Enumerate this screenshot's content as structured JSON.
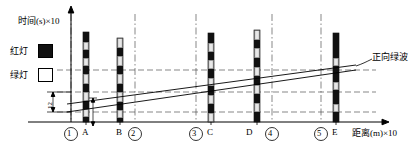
{
  "figure": {
    "type": "time-space-diagram",
    "y_axis_label": "时间(s)×10",
    "x_axis_label": "距离(m)×10",
    "band_label": "正向绿波",
    "offset_label": "12",
    "legend": [
      {
        "label": "红灯",
        "swatch": "filled-black-square",
        "meaning": "red-light"
      },
      {
        "label": "绿灯",
        "swatch": "empty-white-square",
        "meaning": "green-light"
      }
    ],
    "x_ticks": [
      {
        "id": "1",
        "label": "①",
        "circled": true,
        "x": 71
      },
      {
        "id": "A",
        "label": "A",
        "circled": false,
        "x": 86
      },
      {
        "id": "B",
        "label": "B",
        "circled": false,
        "x": 120
      },
      {
        "id": "2",
        "label": "②",
        "circled": true,
        "x": 135
      },
      {
        "id": "3",
        "label": "③",
        "circled": true,
        "x": 196
      },
      {
        "id": "C",
        "label": "C",
        "circled": false,
        "x": 211
      },
      {
        "id": "D",
        "label": "D",
        "circled": false,
        "x": 257
      },
      {
        "id": "4",
        "label": "④",
        "circled": true,
        "x": 272
      },
      {
        "id": "5",
        "label": "⑤",
        "circled": true,
        "x": 321
      },
      {
        "id": "E",
        "label": "E",
        "circled": false,
        "x": 336
      }
    ],
    "gridlines_vertical_x": [
      71,
      135,
      196,
      272,
      321
    ],
    "gridlines_horizontal_y": [
      70,
      92,
      112
    ],
    "axes": {
      "origin_x": 57,
      "origin_y": 122,
      "top_y": 8,
      "right_x": 388
    },
    "signal_bars": [
      {
        "at": "A",
        "x": 86,
        "top": 32,
        "bottom": 122,
        "segments": [
          {
            "state": "red",
            "y0": 32,
            "y1": 42
          },
          {
            "state": "green",
            "y0": 42,
            "y1": 50
          },
          {
            "state": "red",
            "y0": 50,
            "y1": 58
          },
          {
            "state": "green",
            "y0": 58,
            "y1": 66
          },
          {
            "state": "red",
            "y0": 66,
            "y1": 74
          },
          {
            "state": "green",
            "y0": 74,
            "y1": 84
          },
          {
            "state": "red",
            "y0": 84,
            "y1": 92
          },
          {
            "state": "green",
            "y0": 92,
            "y1": 101
          },
          {
            "state": "red",
            "y0": 101,
            "y1": 109
          },
          {
            "state": "green",
            "y0": 109,
            "y1": 117
          },
          {
            "state": "red",
            "y0": 117,
            "y1": 122
          }
        ]
      },
      {
        "at": "B",
        "x": 120,
        "top": 38,
        "bottom": 122,
        "segments": [
          {
            "state": "green",
            "y0": 38,
            "y1": 48
          },
          {
            "state": "red",
            "y0": 48,
            "y1": 56
          },
          {
            "state": "green",
            "y0": 56,
            "y1": 66
          },
          {
            "state": "red",
            "y0": 66,
            "y1": 74
          },
          {
            "state": "green",
            "y0": 74,
            "y1": 84
          },
          {
            "state": "red",
            "y0": 84,
            "y1": 92
          },
          {
            "state": "green",
            "y0": 92,
            "y1": 102
          },
          {
            "state": "red",
            "y0": 102,
            "y1": 110
          },
          {
            "state": "green",
            "y0": 110,
            "y1": 118
          },
          {
            "state": "red",
            "y0": 118,
            "y1": 122
          }
        ]
      },
      {
        "at": "C",
        "x": 211,
        "top": 33,
        "bottom": 122,
        "segments": [
          {
            "state": "red",
            "y0": 33,
            "y1": 43
          },
          {
            "state": "green",
            "y0": 43,
            "y1": 52
          },
          {
            "state": "red",
            "y0": 52,
            "y1": 60
          },
          {
            "state": "green",
            "y0": 60,
            "y1": 69
          },
          {
            "state": "red",
            "y0": 69,
            "y1": 78
          },
          {
            "state": "green",
            "y0": 78,
            "y1": 86
          },
          {
            "state": "red",
            "y0": 86,
            "y1": 95
          },
          {
            "state": "green",
            "y0": 95,
            "y1": 104
          },
          {
            "state": "red",
            "y0": 104,
            "y1": 113
          },
          {
            "state": "green",
            "y0": 113,
            "y1": 122
          }
        ]
      },
      {
        "at": "D",
        "x": 257,
        "top": 30,
        "bottom": 122,
        "segments": [
          {
            "state": "green",
            "y0": 30,
            "y1": 40
          },
          {
            "state": "red",
            "y0": 40,
            "y1": 48
          },
          {
            "state": "green",
            "y0": 48,
            "y1": 58
          },
          {
            "state": "red",
            "y0": 58,
            "y1": 67
          },
          {
            "state": "green",
            "y0": 67,
            "y1": 76
          },
          {
            "state": "red",
            "y0": 76,
            "y1": 85
          },
          {
            "state": "green",
            "y0": 85,
            "y1": 94
          },
          {
            "state": "red",
            "y0": 94,
            "y1": 103
          },
          {
            "state": "green",
            "y0": 103,
            "y1": 112
          },
          {
            "state": "red",
            "y0": 112,
            "y1": 122
          }
        ]
      },
      {
        "at": "E",
        "x": 336,
        "top": 33,
        "bottom": 122,
        "segments": [
          {
            "state": "red",
            "y0": 33,
            "y1": 58
          },
          {
            "state": "green",
            "y0": 58,
            "y1": 66
          },
          {
            "state": "red",
            "y0": 66,
            "y1": 82
          },
          {
            "state": "green",
            "y0": 82,
            "y1": 90
          },
          {
            "state": "red",
            "y0": 90,
            "y1": 104
          },
          {
            "state": "green",
            "y0": 104,
            "y1": 112
          },
          {
            "state": "red",
            "y0": 112,
            "y1": 122
          }
        ]
      }
    ],
    "green_band": {
      "upper_line": {
        "x0": 67,
        "y0": 104,
        "x1": 356,
        "y1": 65
      },
      "lower_line": {
        "x0": 67,
        "y0": 112,
        "x1": 356,
        "y1": 70
      }
    },
    "colors": {
      "red_light": "#000000",
      "green_light": "#ffffff",
      "bar_body": "#9a9a9a",
      "axis": "#000000",
      "grid": "#555555"
    }
  }
}
